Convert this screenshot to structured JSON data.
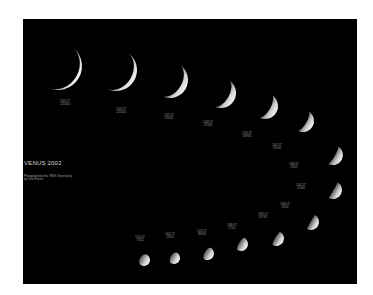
{
  "image": {
    "description": "Photographic sequence of the phases of Venus during 2002, arranged in a curving arc on a black background",
    "background_color": "#000000",
    "page_color": "#ffffff"
  },
  "caption": {
    "title": "VENUS   2002",
    "line1": "Photographed at the TBGS Observatory",
    "line2": "by Chris Proctor"
  },
  "phases": [
    {
      "time": "1341 UT",
      "date": "22/10/02"
    },
    {
      "time": "1342 UT",
      "date": "12/10/02"
    },
    {
      "time": "1352 UT",
      "date": "5/10/02"
    },
    {
      "time": "1403 UT",
      "date": "22/9/02"
    },
    {
      "time": "1519 UT",
      "date": "18/9/02"
    },
    {
      "time": "1347 UT",
      "date": "13/9/02"
    },
    {
      "time": "1346 UT",
      "date": "2/9/02"
    },
    {
      "time": "1342 UT",
      "date": "11/8/02"
    },
    {
      "time": "1403 UT",
      "date": "1/8/02"
    },
    {
      "time": "1832 UT",
      "date": "20/7/02"
    },
    {
      "time": "1846 UT",
      "date": "5/7/02"
    },
    {
      "time": "1525 UT",
      "date": "18/6/02"
    },
    {
      "time": "1602 UT",
      "date": "1/6/02"
    },
    {
      "time": "1515 UT",
      "date": "7/5/02"
    }
  ]
}
